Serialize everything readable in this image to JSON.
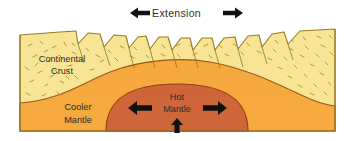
{
  "figure": {
    "title_label": "Extension",
    "caption_arrows": {
      "left_icon": "arrow-left-icon",
      "right_icon": "arrow-right-icon"
    }
  },
  "layers": [
    {
      "id": "continental-crust",
      "label_line1": "Continental",
      "label_line2": "Crust",
      "color": "#F7E596",
      "stroke": "#9A7B22"
    },
    {
      "id": "cooler-mantle",
      "label_line1": "Cooler",
      "label_line2": "Mantle",
      "color": "#F5A93F",
      "stroke": "#9A5A18"
    },
    {
      "id": "hot-mantle",
      "label_line1": "Hot",
      "label_line2": "Mantle",
      "color": "#CE6639",
      "stroke": "#8E3E17"
    }
  ],
  "flow_arrows": [
    {
      "id": "hot-mantle-arrow-left",
      "icon": "arrow-left-icon",
      "direction": "left"
    },
    {
      "id": "hot-mantle-arrow-right",
      "icon": "arrow-right-icon",
      "direction": "right"
    },
    {
      "id": "hot-mantle-arrow-up",
      "icon": "arrow-up-icon",
      "direction": "up"
    }
  ],
  "colors": {
    "crust_fill": "#F7E596",
    "crust_stroke": "#9A7B22",
    "cooler_mantle_fill": "#F5A93F",
    "cooler_mantle_stroke": "#9A5A18",
    "hot_mantle_fill": "#CE6639",
    "hot_mantle_stroke": "#8E3E17",
    "speckle": "#A88B2E",
    "arrow_black": "#111111",
    "text": "#2b2b2b",
    "background": "#FFFFFF"
  }
}
